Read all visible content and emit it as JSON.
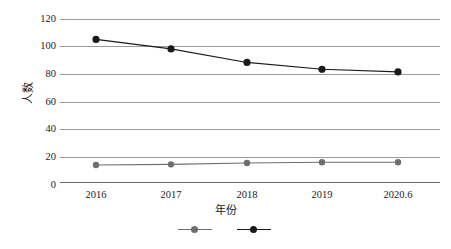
{
  "chart_data": {
    "type": "line",
    "title": "",
    "xlabel": "年份",
    "ylabel": "人数",
    "categories": [
      "2016",
      "2017",
      "2018",
      "2019",
      "2020.6"
    ],
    "ylim": [
      0,
      120
    ],
    "yticks": [
      0,
      20,
      40,
      60,
      80,
      100,
      120
    ],
    "ytick_labels": [
      "0",
      "20",
      "40",
      "60",
      "80",
      "100",
      "120"
    ],
    "grid": true,
    "legend_position": "bottom",
    "series": [
      {
        "name": "series-1",
        "color": "#6e6e6e",
        "marker": "circle",
        "values": [
          12.5,
          13,
          14,
          14.5,
          14.5
        ]
      },
      {
        "name": "series-2",
        "color": "#1a1a1a",
        "marker": "circle",
        "values": [
          105,
          98,
          88,
          83,
          81
        ]
      }
    ]
  },
  "axis": {
    "y_title": "人数",
    "x_title": "年份",
    "y_tick_0": "0",
    "y_tick_20": "20",
    "y_tick_40": "40",
    "y_tick_60": "60",
    "y_tick_80": "80",
    "y_tick_100": "100",
    "y_tick_120": "120",
    "x_tick_0": "2016",
    "x_tick_1": "2017",
    "x_tick_2": "2018",
    "x_tick_3": "2019",
    "x_tick_4": "2020.6"
  },
  "legend": {
    "item_1_label": "",
    "item_2_label": "",
    "item_1_color": "#6e6e6e",
    "item_2_color": "#1a1a1a"
  },
  "caption": {
    "text": ""
  },
  "colors": {
    "gridline": "#9a9a9a",
    "axis": "#6b6b6b",
    "series_light": "#6e6e6e",
    "series_dark": "#1a1a1a",
    "background": "#ffffff"
  }
}
